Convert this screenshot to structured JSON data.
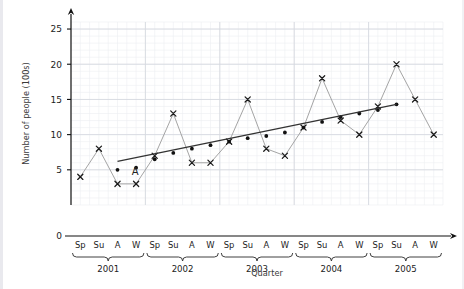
{
  "chart_data": {
    "type": "line",
    "title": "",
    "xlabel": "Quarter",
    "ylabel": "Number of people (100s)",
    "ylim": [
      0,
      26
    ],
    "yticks": [
      0,
      5,
      10,
      15,
      20,
      25
    ],
    "grid": true,
    "legend": "none",
    "categories": [
      "Sp",
      "Su",
      "A",
      "W",
      "Sp",
      "Su",
      "A",
      "W",
      "Sp",
      "Su",
      "A",
      "W",
      "Sp",
      "Su",
      "A",
      "W",
      "Sp",
      "Su",
      "A",
      "W"
    ],
    "year_groups": [
      {
        "label": "2001",
        "start": 0,
        "end": 3
      },
      {
        "label": "2002",
        "start": 4,
        "end": 7
      },
      {
        "label": "2003",
        "start": 8,
        "end": 11
      },
      {
        "label": "2004",
        "start": 12,
        "end": 15
      },
      {
        "label": "2005",
        "start": 16,
        "end": 19
      }
    ],
    "series": [
      {
        "name": "Number of people",
        "marker": "cross",
        "color": "#9a9a9a",
        "values": [
          4,
          8,
          3,
          3,
          7,
          13,
          6,
          6,
          9,
          15,
          8,
          7,
          11,
          18,
          12,
          10,
          14,
          20,
          15,
          10
        ]
      },
      {
        "name": "Four-quarter moving average",
        "marker": "dot",
        "color": "#111111",
        "values": [
          null,
          null,
          5.0,
          5.3,
          6.5,
          7.4,
          8.0,
          8.5,
          9.0,
          9.5,
          9.8,
          10.3,
          11.0,
          11.8,
          12.5,
          13.0,
          13.5,
          14.3,
          null,
          null
        ]
      }
    ],
    "trend_line": {
      "name": "trend-line",
      "color": "#333333",
      "x_start_index": 2,
      "y_start": 6.2,
      "x_end_index": 17,
      "y_end": 14.3
    },
    "annotations": [
      {
        "label": "A",
        "x_index": 3,
        "y": 4.2
      }
    ]
  },
  "axis": {
    "y_title": "Number of people (100s)",
    "x_title": "Quarter",
    "y_tick_labels": [
      "0",
      "5",
      "10",
      "15",
      "20",
      "25"
    ]
  }
}
